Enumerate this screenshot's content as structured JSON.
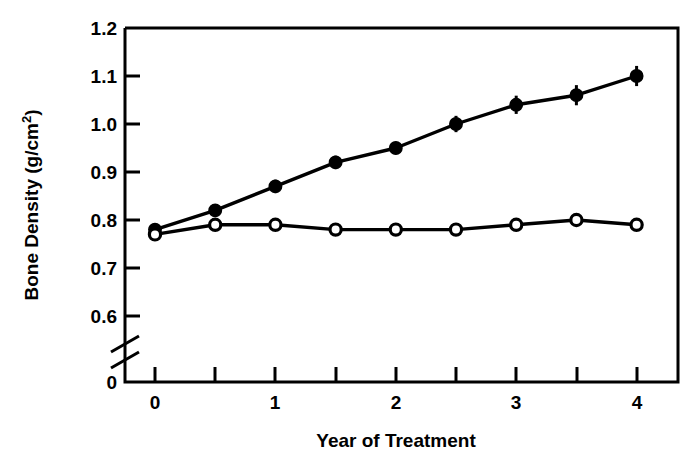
{
  "chart_data": {
    "type": "line",
    "title": "",
    "xlabel": "Year of Treatment",
    "ylabel": "Bone Density (g/cm2)",
    "ylabel_base": "Bone Density (g/cm",
    "ylabel_sup": "2",
    "ylabel_close": ")",
    "x": [
      0,
      0.5,
      1,
      1.5,
      2,
      2.5,
      3,
      3.5,
      4
    ],
    "xlim": [
      -0.2,
      4.3
    ],
    "ylim": [
      0.555,
      1.2
    ],
    "y_axis_break": true,
    "y_break_label": "0",
    "grid": false,
    "legend": "none",
    "xticks": [
      0,
      0.5,
      1,
      1.5,
      2,
      2.5,
      3,
      3.5,
      4
    ],
    "xtick_labels": [
      "0",
      "",
      "1",
      "",
      "2",
      "",
      "3",
      "",
      "4"
    ],
    "yticks": [
      0.6,
      0.7,
      0.8,
      0.9,
      1.0,
      1.1,
      1.2
    ],
    "ytick_labels": [
      "0.6",
      "0.7",
      "0.8",
      "0.9",
      "1.0",
      "1.1",
      "1.2"
    ],
    "series": [
      {
        "name": "treatment-filled",
        "marker": "filled-circle",
        "values": [
          0.78,
          0.82,
          0.87,
          0.92,
          0.95,
          1.0,
          1.04,
          1.06,
          1.1
        ],
        "errors": [
          0.012,
          0.013,
          0.014,
          0.014,
          0.013,
          0.017,
          0.019,
          0.021,
          0.021
        ]
      },
      {
        "name": "control-open",
        "marker": "open-circle",
        "values": [
          0.77,
          0.79,
          0.79,
          0.78,
          0.78,
          0.78,
          0.79,
          0.8,
          0.79
        ],
        "errors": [
          0.01,
          0.01,
          0.01,
          0.01,
          0.01,
          0.009,
          0.009,
          0.01,
          0.009
        ]
      }
    ],
    "colors": {
      "axis": "#000000",
      "series_filled": "#000000",
      "series_open_fill": "#ffffff",
      "series_open_stroke": "#000000",
      "background": "#ffffff"
    }
  }
}
